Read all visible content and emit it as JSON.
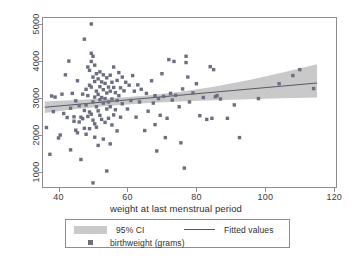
{
  "chart_data": {
    "type": "scatter",
    "title": "",
    "xlabel": "weight at last menstrual period",
    "ylabel": "",
    "xlim": [
      35.5,
      120.5
    ],
    "ylim": [
      600,
      5150
    ],
    "xticks": [
      40,
      60,
      80,
      100,
      120
    ],
    "yticks": [
      1000,
      2000,
      3000,
      4000,
      5000
    ],
    "grid": false,
    "legend_position": "below-axis",
    "series": [
      {
        "name": "birthweight (grams)",
        "type": "scatter",
        "marker": "square",
        "color": "#6b6e80",
        "points": [
          [
            36.5,
            2200
          ],
          [
            37.5,
            1480
          ],
          [
            38.0,
            3050
          ],
          [
            38.5,
            2630
          ],
          [
            39.0,
            3020
          ],
          [
            40.0,
            1920
          ],
          [
            40.5,
            2000
          ],
          [
            41.0,
            3100
          ],
          [
            41.5,
            2580
          ],
          [
            42.0,
            3620
          ],
          [
            42.5,
            2470
          ],
          [
            43.0,
            3990
          ],
          [
            43.5,
            2720
          ],
          [
            43.5,
            1600
          ],
          [
            44.0,
            3120
          ],
          [
            44.5,
            2370
          ],
          [
            44.5,
            2490
          ],
          [
            45.0,
            2130
          ],
          [
            45.0,
            2920
          ],
          [
            45.5,
            2060
          ],
          [
            45.5,
            3460
          ],
          [
            46.0,
            2350
          ],
          [
            46.0,
            2790
          ],
          [
            46.5,
            1340
          ],
          [
            46.5,
            2480
          ],
          [
            47.0,
            2440
          ],
          [
            47.0,
            3100
          ],
          [
            47.5,
            4580
          ],
          [
            47.5,
            2660
          ],
          [
            47.5,
            2180
          ],
          [
            48.0,
            3230
          ],
          [
            48.0,
            2810
          ],
          [
            48.0,
            2020
          ],
          [
            48.5,
            3830
          ],
          [
            48.5,
            3060
          ],
          [
            48.5,
            2500
          ],
          [
            49.0,
            3740
          ],
          [
            49.0,
            3340
          ],
          [
            49.0,
            2620
          ],
          [
            49.0,
            2170
          ],
          [
            49.5,
            4990
          ],
          [
            49.5,
            4200
          ],
          [
            49.5,
            3980
          ],
          [
            49.5,
            3290
          ],
          [
            49.5,
            2560
          ],
          [
            50.0,
            4120
          ],
          [
            50.0,
            3560
          ],
          [
            50.0,
            2890
          ],
          [
            50.0,
            2400
          ],
          [
            50.0,
            710
          ],
          [
            50.5,
            3880
          ],
          [
            50.5,
            3440
          ],
          [
            50.5,
            3020
          ],
          [
            50.5,
            2300
          ],
          [
            50.5,
            1940
          ],
          [
            51.0,
            3650
          ],
          [
            51.0,
            3180
          ],
          [
            51.0,
            2760
          ],
          [
            51.0,
            2210
          ],
          [
            51.5,
            3510
          ],
          [
            51.5,
            3090
          ],
          [
            51.5,
            2650
          ],
          [
            51.5,
            1720
          ],
          [
            52.0,
            3700
          ],
          [
            52.0,
            3300
          ],
          [
            52.0,
            2950
          ],
          [
            52.0,
            2530
          ],
          [
            52.5,
            3430
          ],
          [
            52.5,
            3010
          ],
          [
            52.5,
            2420
          ],
          [
            53.0,
            3620
          ],
          [
            53.0,
            3220
          ],
          [
            53.0,
            2860
          ],
          [
            53.0,
            1890
          ],
          [
            53.5,
            3390
          ],
          [
            53.5,
            2980
          ],
          [
            53.5,
            2340
          ],
          [
            54.0,
            3540
          ],
          [
            54.0,
            3130
          ],
          [
            54.0,
            2700
          ],
          [
            54.0,
            1030
          ],
          [
            54.5,
            3290
          ],
          [
            54.5,
            2890
          ],
          [
            54.5,
            2450
          ],
          [
            55.0,
            3610
          ],
          [
            55.0,
            3180
          ],
          [
            55.0,
            2760
          ],
          [
            55.0,
            1760
          ],
          [
            55.5,
            3420
          ],
          [
            55.5,
            2970
          ],
          [
            55.5,
            2270
          ],
          [
            56.0,
            3830
          ],
          [
            56.0,
            3280
          ],
          [
            56.0,
            2540
          ],
          [
            56.5,
            3140
          ],
          [
            56.5,
            2680
          ],
          [
            57.0,
            3470
          ],
          [
            57.0,
            2930
          ],
          [
            57.0,
            2110
          ],
          [
            57.5,
            3680
          ],
          [
            57.5,
            3060
          ],
          [
            58.0,
            3270
          ],
          [
            58.0,
            2480
          ],
          [
            58.5,
            3560
          ],
          [
            58.5,
            2840
          ],
          [
            59.0,
            3190
          ],
          [
            59.5,
            3420
          ],
          [
            60.0,
            2700
          ],
          [
            60.5,
            3340
          ],
          [
            61.0,
            2930
          ],
          [
            61.5,
            3600
          ],
          [
            62.0,
            3180
          ],
          [
            62.5,
            2480
          ],
          [
            63.0,
            3350
          ],
          [
            63.5,
            2890
          ],
          [
            64.0,
            3230
          ],
          [
            65.0,
            2120
          ],
          [
            65.5,
            3120
          ],
          [
            66.0,
            2640
          ],
          [
            67.0,
            3460
          ],
          [
            67.5,
            2860
          ],
          [
            68.0,
            2280
          ],
          [
            68.0,
            3060
          ],
          [
            68.5,
            1570
          ],
          [
            69.0,
            2980
          ],
          [
            69.5,
            2530
          ],
          [
            70.0,
            3650
          ],
          [
            70.5,
            3040
          ],
          [
            71.0,
            1930
          ],
          [
            71.5,
            2450
          ],
          [
            72.0,
            4030
          ],
          [
            72.5,
            3120
          ],
          [
            73.0,
            2940
          ],
          [
            73.5,
            3980
          ],
          [
            74.0,
            3070
          ],
          [
            75.0,
            2760
          ],
          [
            75.5,
            1790
          ],
          [
            76.0,
            3240
          ],
          [
            76.5,
            1110
          ],
          [
            77.0,
            4120
          ],
          [
            77.0,
            3950
          ],
          [
            77.5,
            3560
          ],
          [
            78.0,
            2890
          ],
          [
            79.0,
            3130
          ],
          [
            80.0,
            3380
          ],
          [
            81.0,
            2520
          ],
          [
            82.0,
            3010
          ],
          [
            83.0,
            2420
          ],
          [
            84.0,
            3840
          ],
          [
            84.5,
            2450
          ],
          [
            85.0,
            3760
          ],
          [
            85.5,
            3030
          ],
          [
            86.0,
            3060
          ],
          [
            87.0,
            2970
          ],
          [
            89.0,
            2450
          ],
          [
            91.0,
            2810
          ],
          [
            92.5,
            1930
          ],
          [
            98.0,
            2980
          ],
          [
            104.0,
            3380
          ],
          [
            108.0,
            3600
          ],
          [
            110.0,
            3760
          ],
          [
            114.0,
            3250
          ]
        ]
      },
      {
        "name": "Fitted values",
        "type": "line",
        "color": "#565a68",
        "x": [
          36.0,
          115.0
        ],
        "y": [
          2748,
          3402
        ]
      },
      {
        "name": "95% CI",
        "type": "band",
        "color": "#c9c9c9",
        "x": [
          36.0,
          45.0,
          55.0,
          65.0,
          75.0,
          85.0,
          95.0,
          105.0,
          115.0
        ],
        "lower": [
          2595,
          2700,
          2790,
          2855,
          2900,
          2935,
          2965,
          2990,
          3010
        ],
        "upper": [
          2900,
          2945,
          2990,
          3055,
          3160,
          3300,
          3475,
          3680,
          3905
        ]
      }
    ]
  },
  "legend": {
    "ci_label": "95% CI",
    "fitted_label": "Fitted values",
    "scatter_label": "birthweight (grams)"
  },
  "axis": {
    "x_title": "weight at last menstrual period"
  },
  "colors": {
    "marker": "#6b6e80",
    "band": "#c9c9c9",
    "line": "#565a68",
    "frame": "#8d8d8d",
    "text": "#2e2e2e"
  }
}
